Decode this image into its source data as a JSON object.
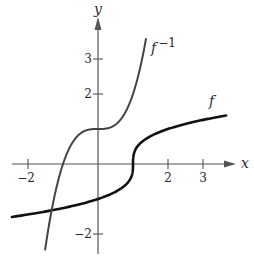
{
  "figure": {
    "axes": {
      "x_label": "x",
      "y_label": "y",
      "x_ticks": [
        {
          "value": -2,
          "label": "−2"
        },
        {
          "value": 2,
          "label": "2"
        },
        {
          "value": 3,
          "label": "3"
        }
      ],
      "y_ticks": [
        {
          "value": 3,
          "label": "3"
        },
        {
          "value": 2,
          "label": "2"
        },
        {
          "value": -2,
          "label": "−2"
        }
      ],
      "x_range": [
        -2.8,
        4.3
      ],
      "y_range": [
        -2.6,
        4.7
      ],
      "unit_px": 35,
      "origin_px": [
        98,
        164
      ],
      "axis_color": "#555555"
    },
    "curves": [
      {
        "name": "f",
        "label": "f",
        "rule": "cbrt(x - 1)",
        "x_from": -2.46,
        "x_to": 3.66,
        "color": "#111111",
        "width": 2.6
      },
      {
        "name": "f_inverse",
        "label": "f",
        "label_sup": "−1",
        "rule": "x^3 + 1",
        "x_from": -1.51,
        "x_to": 1.37,
        "color": "#444444",
        "width": 2
      }
    ]
  }
}
